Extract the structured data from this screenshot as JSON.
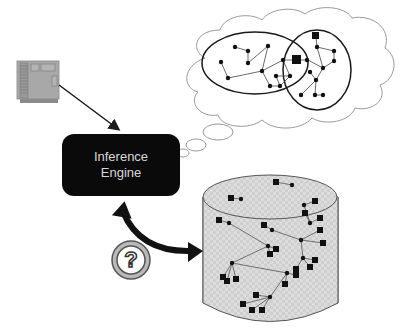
{
  "diagram": {
    "engine": {
      "line1": "Inference",
      "line2": "Engine",
      "fill": "#0a0a0a",
      "text_color": "#d8d8d8"
    },
    "computer_chip": {
      "icon": "circuit-board-icon",
      "fill": "#a8a8a8"
    },
    "query_badge": {
      "icon": "question-mark-icon",
      "glyph": "?"
    },
    "knowledge_base": {
      "shape": "cylinder",
      "fill": "#d9d9d9"
    },
    "thought_cloud": {
      "clusters": 2
    },
    "colors": {
      "stroke": "#1a1a1a",
      "cloud_stroke": "#9a9a9a",
      "edge": "#555555"
    }
  }
}
